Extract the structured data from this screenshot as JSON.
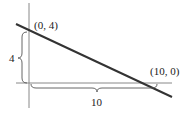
{
  "diagram": {
    "type": "coordinate-line-intercepts",
    "points": [
      {
        "label": "(0, 4)",
        "x": 0,
        "y": 4
      },
      {
        "label": "(10, 0)",
        "x": 10,
        "y": 0
      }
    ],
    "dimensions": [
      {
        "label": "4",
        "orientation": "vertical",
        "meaning": "y-intercept height"
      },
      {
        "label": "10",
        "orientation": "horizontal",
        "meaning": "x-intercept width"
      }
    ],
    "colors": {
      "line": "#333333",
      "axes": "#888888",
      "braces": "#555555",
      "text": "#222222"
    }
  }
}
